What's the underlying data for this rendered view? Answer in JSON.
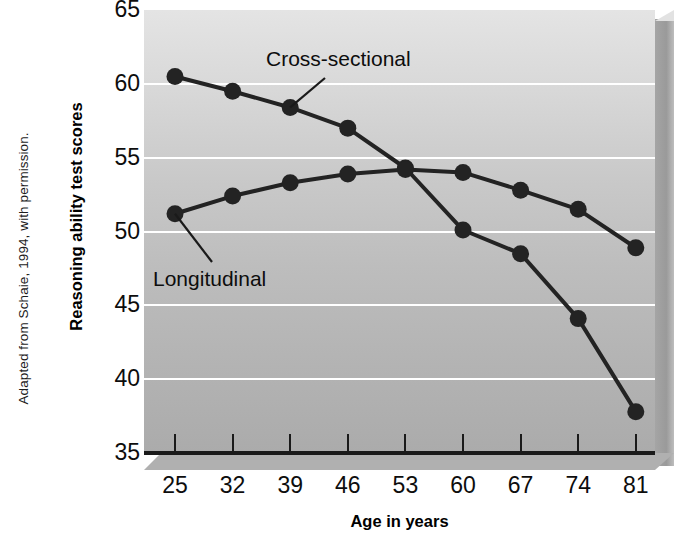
{
  "figure": {
    "credit": "Adapted from Schaie, 1994, with permission."
  },
  "axes": {
    "ylabel": "Reasoning ability test scores",
    "xlabel": "Age in years",
    "yticks": [
      "65",
      "60",
      "55",
      "50",
      "45",
      "40",
      "35"
    ],
    "xticks": [
      "25",
      "32",
      "39",
      "46",
      "53",
      "60",
      "67",
      "74",
      "81"
    ]
  },
  "annotations": {
    "cross_sectional": "Cross-sectional",
    "longitudinal": "Longitudinal"
  },
  "colors": {
    "panel_light": "#e4e4e4",
    "panel_dark": "#ababab",
    "gridline": "#ffffff",
    "series": "#232323",
    "axis": "#1a1a1a",
    "text": "#0d0d0d"
  },
  "chart_data": {
    "type": "line",
    "title": "",
    "xlabel": "Age in years",
    "ylabel": "Reasoning ability test scores",
    "x": [
      25,
      32,
      39,
      46,
      53,
      60,
      67,
      74,
      81
    ],
    "categories": [
      "25",
      "32",
      "39",
      "46",
      "53",
      "60",
      "67",
      "74",
      "81"
    ],
    "xlim": [
      25,
      81
    ],
    "ylim": [
      35,
      65
    ],
    "yticks": [
      35,
      40,
      45,
      50,
      55,
      60,
      65
    ],
    "grid": "horizontal",
    "legend": "annotated-inline",
    "series": [
      {
        "name": "Cross-sectional",
        "values": [
          60.5,
          59.5,
          58.4,
          57.0,
          54.3,
          50.1,
          48.5,
          44.1,
          37.8
        ]
      },
      {
        "name": "Longitudinal",
        "values": [
          51.2,
          52.4,
          53.3,
          53.9,
          54.2,
          54.0,
          52.8,
          51.5,
          48.9
        ]
      }
    ]
  }
}
